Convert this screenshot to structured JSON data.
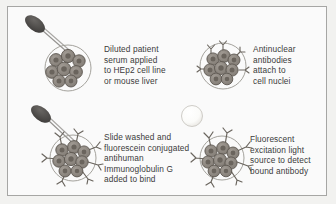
{
  "figure": {
    "background_color": "#f2f2f0",
    "panel_background_color": "#fafafa",
    "border_color": "#a6a6a4",
    "text_color": "#3b3b3b"
  },
  "panels": [
    {
      "id": "panel-1",
      "caption_lines": [
        "Diluted patient",
        "serum applied",
        "to HEp2 cell line",
        "or mouse liver"
      ],
      "artwork": {
        "pipette": "dark grey dropper with bulb and thin stem",
        "cell_cluster": "circle containing cluster of round cells with nuclei",
        "antibodies": "none",
        "light_source": "none"
      }
    },
    {
      "id": "panel-2",
      "caption_lines": [
        "Antinuclear",
        "antibodies",
        "attach to",
        "cell nuclei"
      ],
      "artwork": {
        "pipette": "none",
        "cell_cluster": "circle containing cluster of round cells with nuclei",
        "antibodies": "small Y-shaped antibodies bound to cells",
        "light_source": "none"
      }
    },
    {
      "id": "panel-3",
      "caption_lines": [
        "Slide washed and",
        "fluorescein conjugated",
        "antihuman",
        "Immunoglobulin G",
        "added to bind"
      ],
      "artwork": {
        "pipette": "dark grey dropper with bulb and thin stem",
        "cell_cluster": "circle containing cluster of round cells with nuclei",
        "antibodies": "many Y-shaped antibodies radiating from cells",
        "light_source": "none"
      }
    },
    {
      "id": "panel-4",
      "caption_lines": [
        "Fluorescent",
        "excitation light",
        "source to detect",
        "bound antibody"
      ],
      "artwork": {
        "pipette": "none",
        "cell_cluster": "circle containing cluster of round cells with nuclei",
        "antibodies": "many Y-shaped antibodies radiating from cells",
        "light_source": "glowing pale circular lamp aimed at cells"
      }
    }
  ],
  "colors": {
    "cell_fill": "#8d8781",
    "cell_outline": "#5c5750",
    "nucleus_fill": "#6d6760",
    "circle_outline": "#9a9791",
    "pipette_bulb": "#4a4846",
    "pipette_stem": "#8a8886",
    "antibody_stroke": "#6a655e",
    "lamp_fill": "#fdfdfb",
    "lamp_outline": "#c9c7c2"
  }
}
